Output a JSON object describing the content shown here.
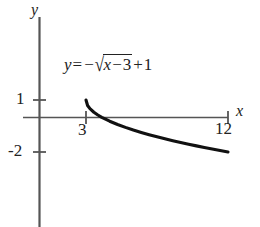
{
  "chart_data": {
    "type": "line",
    "title": "",
    "equation_text": "y = -√(x - 3) + 1",
    "equation": {
      "lhs": "y",
      "equals": "=",
      "minus": "−",
      "surd": "√",
      "radicand_var": "x",
      "radicand_minus": "−",
      "radicand_const": "3",
      "plus": "+",
      "constant": "1"
    },
    "xlabel": "x",
    "ylabel": "y",
    "xlim": [
      -2.5,
      13.9
    ],
    "ylim": [
      -6.0,
      5.7
    ],
    "grid": false,
    "legend": null,
    "axis_color": "#555555",
    "curve_color": "#111111",
    "curve_width": 3.1,
    "domain": [
      3,
      12
    ],
    "x_ticks": [
      {
        "value": 3,
        "label": "3"
      },
      {
        "value": 12,
        "label": "12"
      }
    ],
    "y_ticks": [
      {
        "value": 1,
        "label": "1"
      },
      {
        "value": -2,
        "label": "-2"
      }
    ],
    "x": [
      3,
      3.1,
      3.25,
      3.5,
      3.75,
      4,
      4.5,
      5,
      5.5,
      6,
      6.5,
      7,
      7.5,
      8,
      8.5,
      9,
      9.5,
      10,
      10.5,
      11,
      11.5,
      12
    ],
    "y": [
      1,
      0.684,
      0.5,
      0.293,
      0.134,
      0,
      -0.225,
      -0.414,
      -0.581,
      -0.732,
      -0.871,
      -1,
      -1.121,
      -1.236,
      -1.345,
      -1.449,
      -1.55,
      -1.646,
      -1.739,
      -1.828,
      -1.915,
      -2
    ],
    "key_points": [
      {
        "x": 3,
        "y": 1,
        "note": "start point"
      },
      {
        "x": 4,
        "y": 0,
        "note": "x-intercept"
      },
      {
        "x": 12,
        "y": -2,
        "note": "end point"
      }
    ]
  }
}
